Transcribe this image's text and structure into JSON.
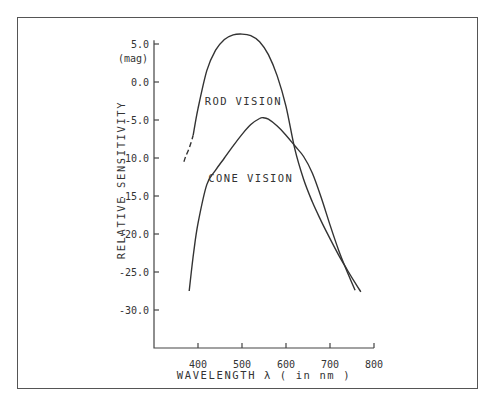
{
  "chart_data": {
    "type": "line",
    "title": "",
    "xlabel": "WAVELENGTH λ ( in nm )",
    "ylabel": "RELATIVE SENSITIVITY",
    "yunit": "(mag)",
    "xlim": [
      300,
      800
    ],
    "ylim": [
      -35,
      5.5
    ],
    "xticks": [
      400,
      500,
      600,
      700,
      800
    ],
    "xtick_labels": [
      "400",
      "500",
      "600",
      "700",
      "800"
    ],
    "yticks": [
      5,
      0,
      -5,
      -10,
      -15,
      -20,
      -25,
      -30
    ],
    "ytick_labels": [
      "5.0",
      "0.0",
      "-5.0",
      "-10.0",
      "-15.0",
      "-20.0",
      "-25.0",
      "-30.0"
    ],
    "grid": false,
    "legend": "inline labels",
    "series": [
      {
        "name": "ROD VISION",
        "label_pos": [
          503,
          -3.0
        ],
        "dashed_segment": {
          "x": [
            368,
            372,
            378,
            384,
            389
          ],
          "y": [
            -10.5,
            -9.8,
            -9.0,
            -8.0,
            -7.0
          ]
        },
        "x": [
          389,
          400,
          420,
          440,
          460,
          480,
          500,
          520,
          540,
          560,
          580,
          600,
          620,
          640,
          660,
          680,
          700,
          720,
          740,
          760,
          770
        ],
        "y": [
          -7.0,
          -3.5,
          1.5,
          4.2,
          5.6,
          6.2,
          6.3,
          6.1,
          5.3,
          3.6,
          0.8,
          -3.2,
          -8.8,
          -12.8,
          -15.8,
          -18.3,
          -20.6,
          -22.8,
          -24.8,
          -26.7,
          -27.6
        ]
      },
      {
        "name": "CONE VISION",
        "label_pos": [
          520,
          -13.2
        ],
        "x": [
          380,
          390,
          400,
          420,
          440,
          460,
          480,
          500,
          520,
          540,
          548,
          560,
          580,
          600,
          620,
          640,
          660,
          680,
          700,
          720,
          740,
          757
        ],
        "y": [
          -27.5,
          -22.5,
          -18.6,
          -13.5,
          -11.6,
          -10.0,
          -8.4,
          -6.9,
          -5.6,
          -4.8,
          -4.7,
          -4.9,
          -5.8,
          -7.0,
          -8.4,
          -9.8,
          -12.0,
          -15.2,
          -18.8,
          -22.2,
          -25.1,
          -27.4
        ]
      }
    ]
  }
}
